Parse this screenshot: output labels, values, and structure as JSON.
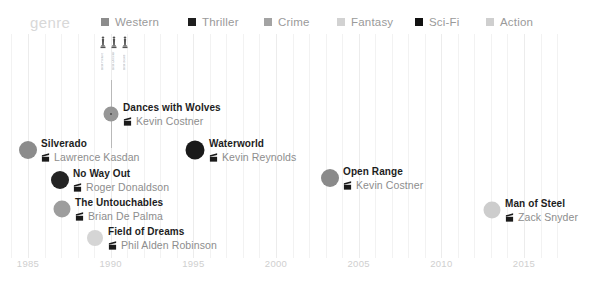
{
  "legend": {
    "title": "genre",
    "items": [
      {
        "label": "Western",
        "color": "#8c8c8c",
        "x": 101
      },
      {
        "label": "Thriller",
        "color": "#1f1f1f",
        "x": 188
      },
      {
        "label": "Crime",
        "color": "#a3a3a3",
        "x": 264
      },
      {
        "label": "Fantasy",
        "color": "#d2d2d2",
        "x": 337
      },
      {
        "label": "Sci-Fi",
        "color": "#111111",
        "x": 415
      },
      {
        "label": "Action",
        "color": "#cfcfcf",
        "x": 486
      }
    ]
  },
  "axis": {
    "ticks": [
      "1985",
      "1990",
      "1995",
      "2000",
      "2005",
      "2010",
      "2015"
    ],
    "tick_years": [
      1985,
      1990,
      1995,
      2000,
      2005,
      2010,
      2015
    ],
    "range": [
      1984,
      2017
    ]
  },
  "awards": {
    "attached_to": "Dances with Wolves",
    "year": 1990,
    "items": [
      {
        "icon": "oscar-statuette-icon",
        "label": "Best Picture"
      },
      {
        "icon": "oscar-statuette-icon",
        "label": "Best Director"
      },
      {
        "icon": "oscar-statuette-icon",
        "label": "Best Score"
      }
    ]
  },
  "chart_data": {
    "type": "scatter",
    "title": "",
    "xlabel": "",
    "ylabel": "",
    "xlim": [
      1984,
      2017
    ],
    "grid": true,
    "legend_position": "top",
    "points": [
      {
        "title": "Silverado",
        "director": "Lawrence Kasdan",
        "genre": "Western",
        "color": "#8c8c8c",
        "year": 1985,
        "x": 28,
        "y": 150,
        "r": 9,
        "label_dx": 13,
        "label_dy": -12
      },
      {
        "title": "Dances with Wolves",
        "director": "Kevin Costner",
        "genre": "Western",
        "color": "#969696",
        "year": 1990,
        "x": 111,
        "y": 114,
        "r": 7.5,
        "label_dx": 12,
        "label_dy": -12,
        "center_dot": true
      },
      {
        "title": "No Way Out",
        "director": "Roger Donaldson",
        "genre": "Thriller",
        "color": "#242424",
        "year": 1987,
        "x": 60,
        "y": 180,
        "r": 9,
        "label_dx": 13,
        "label_dy": -12
      },
      {
        "title": "The Untouchables",
        "director": "Brian De Palma",
        "genre": "Crime",
        "color": "#9d9d9d",
        "year": 1987,
        "x": 62,
        "y": 209,
        "r": 8.5,
        "label_dx": 13,
        "label_dy": -12
      },
      {
        "title": "Field of Dreams",
        "director": "Phil Alden Robinson",
        "genre": "Fantasy",
        "color": "#d5d5d5",
        "year": 1989,
        "x": 95,
        "y": 238,
        "r": 8,
        "label_dx": 13,
        "label_dy": -12
      },
      {
        "title": "Waterworld",
        "director": "Kevin Reynolds",
        "genre": "Sci-Fi",
        "color": "#1a1a1a",
        "year": 1995,
        "x": 195,
        "y": 150,
        "r": 9.5,
        "label_dx": 14,
        "label_dy": -12
      },
      {
        "title": "Open Range",
        "director": "Kevin Costner",
        "genre": "Western",
        "color": "#8a8a8a",
        "year": 2003,
        "x": 330,
        "y": 178,
        "r": 9,
        "label_dx": 13,
        "label_dy": -12
      },
      {
        "title": "Man of Steel",
        "director": "Zack Snyder",
        "genre": "Action",
        "color": "#cdcdcd",
        "year": 2013,
        "x": 492,
        "y": 210,
        "r": 8.5,
        "label_dx": 13,
        "label_dy": -12
      }
    ]
  }
}
